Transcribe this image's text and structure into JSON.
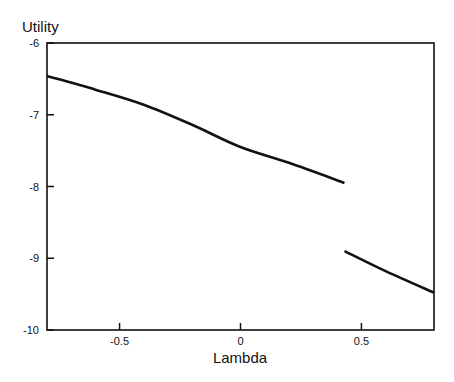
{
  "chart_data": {
    "type": "line",
    "title": "",
    "xlabel": "Lambda",
    "ylabel": "Utility",
    "xlim": [
      -0.8,
      0.8
    ],
    "ylim": [
      -10,
      -6
    ],
    "xticks": [
      -0.5,
      0,
      0.5
    ],
    "xtick_labels": [
      "-0.5",
      "0",
      "0.5"
    ],
    "yticks": [
      -6,
      -7,
      -8,
      -9,
      -10
    ],
    "ytick_labels": [
      "-6",
      "-7",
      "-8",
      "-9",
      "-10"
    ],
    "grid": false,
    "legend": null,
    "series": [
      {
        "name": "segment-1",
        "x": [
          -0.8,
          -0.6,
          -0.4,
          -0.2,
          0.0,
          0.2,
          0.43
        ],
        "y": [
          -6.46,
          -6.65,
          -6.86,
          -7.14,
          -7.45,
          -7.67,
          -7.95
        ]
      },
      {
        "name": "segment-2",
        "x": [
          0.43,
          0.6,
          0.8
        ],
        "y": [
          -8.9,
          -9.18,
          -9.48
        ]
      }
    ],
    "annotations": [
      "Discontinuity (jump) at Lambda ≈ 0.43"
    ]
  }
}
